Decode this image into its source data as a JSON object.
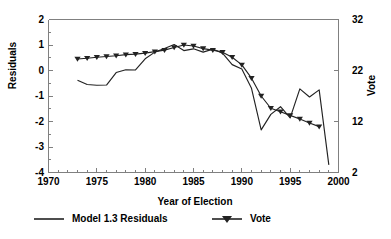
{
  "chart_data": {
    "type": "line",
    "title": "",
    "xlabel": "Year of Election",
    "ylabel": "Residuals",
    "ylabel_right": "Vote",
    "xlim": [
      1970,
      2000
    ],
    "ylim": [
      -4,
      2
    ],
    "ylim_right": [
      2,
      32
    ],
    "grid": false,
    "legend_position": "bottom",
    "xticks": [
      1970,
      1975,
      1980,
      1985,
      1990,
      1995,
      2000
    ],
    "xtick_labels": [
      "1970",
      "1975",
      "1980",
      "1985",
      "1990",
      "1995",
      "2000"
    ],
    "xminor_step": 1,
    "yticks": [
      -4,
      -3,
      -2,
      -1,
      0,
      1,
      2
    ],
    "ytick_labels": [
      "-4",
      "-3",
      "-2",
      "-1",
      "0",
      "1",
      "2"
    ],
    "yminor_step": 0.5,
    "yticks_right": [
      2,
      12,
      22,
      32
    ],
    "ytick_labels_right": [
      "2",
      "12",
      "22",
      "32"
    ],
    "series": [
      {
        "name": "Model 1.3 Residuals",
        "axis": "left",
        "marker": "none",
        "color": "#222222",
        "x": [
          1973,
          1974,
          1975,
          1976,
          1977,
          1978,
          1979,
          1980,
          1981,
          1982,
          1983,
          1984,
          1985,
          1986,
          1987,
          1988,
          1989,
          1990,
          1991,
          1992,
          1993,
          1994,
          1995,
          1996,
          1997,
          1998,
          1999
        ],
        "y": [
          -0.38,
          -0.55,
          -0.58,
          -0.57,
          -0.08,
          0.03,
          0.02,
          0.46,
          0.72,
          0.86,
          1.02,
          0.78,
          0.85,
          0.72,
          0.84,
          0.68,
          0.23,
          0.06,
          -0.7,
          -2.33,
          -1.72,
          -1.42,
          -1.86,
          -0.72,
          -1.04,
          -0.76,
          -3.7
        ]
      },
      {
        "name": "Vote",
        "axis": "right",
        "marker": "triangle-down",
        "color": "#222222",
        "x": [
          1973,
          1974,
          1975,
          1976,
          1977,
          1978,
          1979,
          1980,
          1981,
          1982,
          1983,
          1984,
          1985,
          1986,
          1987,
          1988,
          1989,
          1990,
          1991,
          1992,
          1993,
          1994,
          1995,
          1996,
          1997,
          1998
        ],
        "y": [
          0.45,
          0.48,
          0.52,
          0.55,
          0.58,
          0.62,
          0.64,
          0.68,
          0.74,
          0.8,
          0.9,
          1.0,
          0.96,
          0.86,
          0.8,
          0.72,
          0.52,
          0.22,
          -0.3,
          -1.0,
          -1.48,
          -1.62,
          -1.76,
          -1.9,
          -2.06,
          -2.2
        ],
        "y_right_equivalent": [
          26.1,
          26.3,
          26.6,
          26.7,
          26.9,
          27.2,
          27.3,
          27.6,
          27.9,
          28.3,
          28.8,
          29.3,
          29.1,
          28.6,
          28.3,
          27.9,
          26.9,
          25.4,
          22.8,
          19.3,
          16.9,
          16.2,
          15.5,
          14.8,
          14.0,
          13.3
        ]
      }
    ]
  },
  "legend": {
    "items": [
      {
        "label": "Model 1.3 Residuals",
        "marker": "line"
      },
      {
        "label": "Vote",
        "marker": "line-triangle"
      }
    ]
  },
  "axes": {
    "left_title": "Residuals",
    "right_title": "Vote",
    "bottom_title": "Year of Election"
  },
  "colors": {
    "line": "#222222",
    "axis": "#808080",
    "text": "#000000",
    "background": "#ffffff"
  }
}
